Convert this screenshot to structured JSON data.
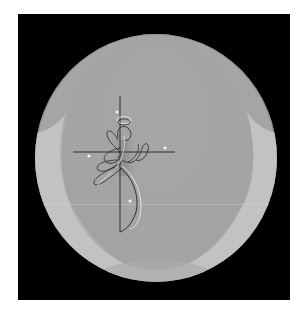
{
  "image": {
    "description": "Photograph of a round grey decorative plate on a black square background with a calligraphic cross and stylized figure design",
    "subject": "decorative plate",
    "motif": "cross with flowing calligraphic figure and sparkle dots"
  },
  "colors": {
    "page_background": "#ffffff",
    "frame_background": "#000000",
    "plate_surface": "#a5a5a5",
    "plate_rim_highlight": "#c4c4c4",
    "ink_dark": "#2a2a2a",
    "ink_light": "#e8e8e8",
    "sparkle": "#f4f4f4"
  },
  "design": {
    "cross": {
      "vertical": {
        "x": 120,
        "y1": 96,
        "y2": 232
      },
      "horizontal": {
        "y": 152,
        "x1": 73,
        "x2": 175
      }
    },
    "sparkles": [
      {
        "x": 117,
        "y": 112
      },
      {
        "x": 89,
        "y": 156
      },
      {
        "x": 165,
        "y": 148
      },
      {
        "x": 130,
        "y": 201
      }
    ]
  }
}
